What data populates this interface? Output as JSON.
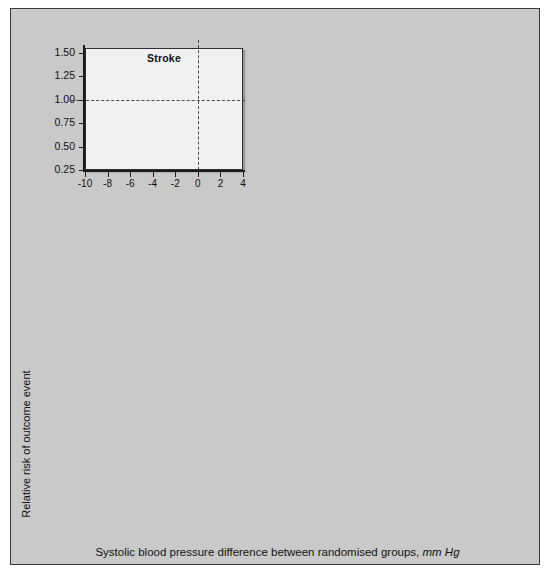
{
  "figure": {
    "xlabel_main": "Systolic blood pressure difference between randomised groups,",
    "xlabel_units": "mm Hg",
    "ylabel": "Relative risk of outcome event",
    "background": "#c9c9c9",
    "plot_background": "#f1f1f1",
    "marker_fill": "#9a9a9a",
    "marker_edge": "#3b3b3b"
  },
  "group_labels": [
    "A",
    "B",
    "C",
    "D",
    "E",
    "F",
    "G"
  ],
  "chart_data": {
    "type": "scatter",
    "xlabel": "Systolic blood pressure difference between randomised groups, mm Hg",
    "ylabel": "Relative risk of outcome event",
    "xlim": [
      -10,
      4
    ],
    "ylim": [
      0.25,
      1.55
    ],
    "xticks": [
      -10,
      -8,
      -6,
      -4,
      -2,
      0,
      2,
      4
    ],
    "xtick_labels": [
      "-10",
      "-8",
      "-6",
      "-4",
      "-2",
      "0",
      "2",
      "4"
    ],
    "yticks": [
      0.25,
      0.5,
      0.75,
      1.0,
      1.25,
      1.5
    ],
    "ytick_labels": [
      "0.25",
      "0.50",
      "0.75",
      "1.00",
      "1.25",
      "1.50"
    ],
    "grid": false,
    "hline_ref": 1.0,
    "vline_ref": 0.0,
    "legend": "none",
    "group_x": [
      -8.3,
      -5.3,
      -4.1,
      -2.0,
      0.35,
      0.8,
      1.8
    ],
    "panels": [
      {
        "title": "Stroke",
        "points": [
          {
            "group": "A",
            "x": -8.3,
            "y": 0.63,
            "lo": 0.5,
            "hi": 0.79
          },
          {
            "group": "B",
            "x": -5.3,
            "y": 0.73,
            "lo": 0.66,
            "hi": 0.82
          },
          {
            "group": "C",
            "x": -4.1,
            "y": 0.8,
            "lo": 0.65,
            "hi": 0.97
          },
          {
            "group": "D",
            "x": -2.0,
            "y": 0.81,
            "lo": 0.7,
            "hi": 0.92
          },
          {
            "group": "E",
            "x": 0.55,
            "y": 1.13,
            "lo": 1.0,
            "hi": 1.26
          },
          {
            "group": "F",
            "x": 0.85,
            "y": 0.95,
            "lo": 0.87,
            "hi": 1.03
          },
          {
            "group": "G",
            "x": 1.85,
            "y": 1.09,
            "lo": 1.0,
            "hi": 1.2
          }
        ]
      },
      {
        "title": "Major CVD",
        "points": [
          {
            "group": "A",
            "x": -8.3,
            "y": 0.81,
            "lo": 0.7,
            "hi": 0.92
          },
          {
            "group": "B",
            "x": -5.3,
            "y": 0.79,
            "lo": 0.75,
            "hi": 0.83
          },
          {
            "group": "C",
            "x": -4.1,
            "y": 0.87,
            "lo": 0.79,
            "hi": 0.97
          },
          {
            "group": "D",
            "x": -2.0,
            "y": 0.91,
            "lo": 0.86,
            "hi": 0.96
          },
          {
            "group": "E",
            "x": 0.55,
            "y": 0.98,
            "lo": 0.94,
            "hi": 1.02
          },
          {
            "group": "F",
            "x": 0.85,
            "y": 1.04,
            "lo": 0.99,
            "hi": 1.09
          },
          {
            "group": "G",
            "x": 1.85,
            "y": 1.03,
            "lo": 0.99,
            "hi": 1.07
          }
        ]
      },
      {
        "title": "CHD",
        "points": [
          {
            "group": "A",
            "x": -8.3,
            "y": 0.77,
            "lo": 0.62,
            "hi": 0.94
          },
          {
            "group": "B",
            "x": -5.3,
            "y": 0.8,
            "lo": 0.74,
            "hi": 0.87
          },
          {
            "group": "C",
            "x": -4.1,
            "y": 0.95,
            "lo": 0.82,
            "hi": 1.11
          },
          {
            "group": "D",
            "x": -2.0,
            "y": 0.96,
            "lo": 0.86,
            "hi": 1.08
          },
          {
            "group": "E",
            "x": 0.55,
            "y": 0.97,
            "lo": 0.91,
            "hi": 1.04
          },
          {
            "group": "F",
            "x": 0.85,
            "y": 1.0,
            "lo": 0.93,
            "hi": 1.06
          },
          {
            "group": "G",
            "x": 1.85,
            "y": 0.99,
            "lo": 0.93,
            "hi": 1.05
          }
        ]
      },
      {
        "title": "CV death",
        "points": [
          {
            "group": "A",
            "x": -8.3,
            "y": 0.79,
            "lo": 0.62,
            "hi": 1.0
          },
          {
            "group": "B",
            "x": -5.3,
            "y": 0.81,
            "lo": 0.73,
            "hi": 0.9
          },
          {
            "group": "C",
            "x": -4.1,
            "y": 0.94,
            "lo": 0.78,
            "hi": 1.13
          },
          {
            "group": "D",
            "x": -2.0,
            "y": 0.95,
            "lo": 0.88,
            "hi": 1.03
          },
          {
            "group": "E",
            "x": 0.55,
            "y": 1.05,
            "lo": 0.98,
            "hi": 1.12
          },
          {
            "group": "F",
            "x": 0.85,
            "y": 1.06,
            "lo": 1.0,
            "hi": 1.13
          },
          {
            "group": "G",
            "x": 1.85,
            "y": 1.05,
            "lo": 0.98,
            "hi": 1.12
          }
        ]
      },
      {
        "title": "Heart failure",
        "points": [
          {
            "group": "A",
            "x": -8.3,
            "y": 1.21,
            "lo": 0.92,
            "hi": 1.58
          },
          {
            "group": "B",
            "x": -5.3,
            "y": 0.83,
            "lo": 0.71,
            "hi": 0.97
          },
          {
            "group": "C",
            "x": -4.1,
            "y": 0.84,
            "lo": 0.59,
            "hi": 1.19
          },
          {
            "group": "D",
            "x": -2.0,
            "y": 0.84,
            "lo": 0.74,
            "hi": 0.95
          },
          {
            "group": "E",
            "x": 0.55,
            "y": 0.83,
            "lo": 0.73,
            "hi": 0.95
          },
          {
            "group": "F",
            "x": 0.85,
            "y": 1.35,
            "lo": 1.22,
            "hi": 1.49
          },
          {
            "group": "G",
            "x": 1.85,
            "y": 1.08,
            "lo": 0.97,
            "hi": 1.2
          }
        ]
      },
      {
        "title": "Total mortality",
        "points": [
          {
            "group": "A",
            "x": -8.3,
            "y": 0.89,
            "lo": 0.76,
            "hi": 1.05
          },
          {
            "group": "B",
            "x": -5.3,
            "y": 0.88,
            "lo": 0.83,
            "hi": 0.94
          },
          {
            "group": "C",
            "x": -4.1,
            "y": 0.97,
            "lo": 0.86,
            "hi": 1.09
          },
          {
            "group": "D",
            "x": -2.0,
            "y": 0.95,
            "lo": 0.89,
            "hi": 1.01
          },
          {
            "group": "E",
            "x": 0.55,
            "y": 1.01,
            "lo": 0.96,
            "hi": 1.06
          },
          {
            "group": "F",
            "x": 0.85,
            "y": 1.04,
            "lo": 0.99,
            "hi": 1.09
          },
          {
            "group": "G",
            "x": 1.85,
            "y": 1.01,
            "lo": 0.97,
            "hi": 1.06
          }
        ]
      }
    ]
  }
}
